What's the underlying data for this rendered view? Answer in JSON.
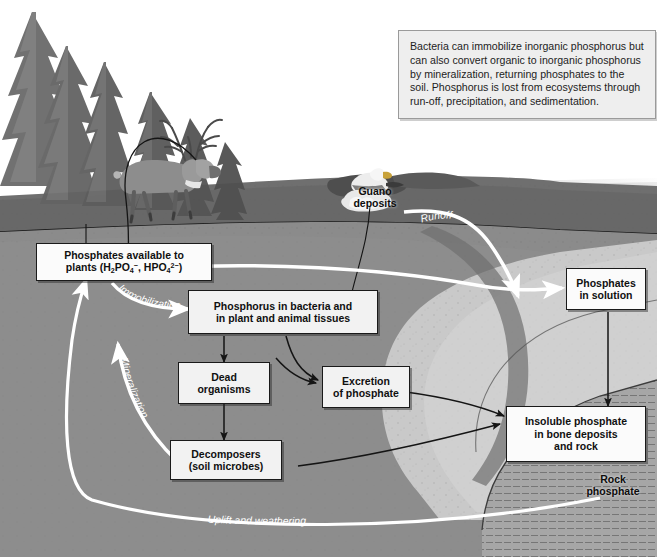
{
  "figure": {
    "note": {
      "text": "Bacteria can immobilize inorganic phosphorus but can also convert organic to inorganic phosphorus by mineralization, returning phosphates to the soil. Phosphorus is lost from ecosystems through run-off, precipitation, and sedimentation."
    },
    "boxes": {
      "plants_line1": "Phosphates available to",
      "plants_line2_pre": "plants (H",
      "plants_line2_mid": "PO",
      "plants_line2_mid2": ", HPO",
      "plants_line2_end": ")",
      "tissues_line1": "Phosphorus in bacteria and",
      "tissues_line2": "in plant and animal tissues",
      "dead_line1": "Dead",
      "dead_line2": "organisms",
      "excretion_line1": "Excretion",
      "excretion_line2": "of phosphate",
      "decomposers_line1": "Decomposers",
      "decomposers_line2": "(soil microbes)",
      "solution_line1": "Phosphates",
      "solution_line2": "in solution",
      "insoluble_line1": "Insoluble phosphate",
      "insoluble_line2": "in bone deposits",
      "insoluble_line3": "and rock"
    },
    "pathway_labels": {
      "immobilization": "Immobilization",
      "mineralization": "Mineralization",
      "leaching": "Leaching",
      "runoff": "Runoff",
      "uplift": "Uplift and weathering"
    },
    "scene_labels": {
      "guano_line1": "Guano",
      "guano_line2": "deposits",
      "rock_line1": "Rock",
      "rock_line2": "phosphate"
    },
    "colors": {
      "sky": "#ffffff",
      "water": "#9a9a9a",
      "grass": "#6e6e6e",
      "soil_upper": "#8a8a8a",
      "soil_mid": "#9a9a9a",
      "sediment_light": "#c8c8c8",
      "rock_layer": "#a8a8a8",
      "box_fill": "#f2f2f2",
      "note_fill": "#eeeeee",
      "arrow_dark": "#151515",
      "arrow_white": "#ffffff"
    }
  }
}
